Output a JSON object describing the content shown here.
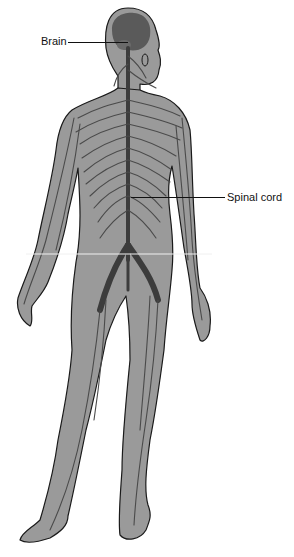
{
  "diagram": {
    "colors": {
      "body_fill": "#9a9a9a",
      "body_outline": "#1a1a1a",
      "nerve": "#4a4a4a",
      "cns": "#3c3c3c",
      "background": "#ffffff"
    },
    "labels": [
      {
        "id": "brain",
        "text": "Brain",
        "x": 41,
        "y": 35,
        "line_from": [
          68,
          42
        ],
        "line_to": [
          128,
          42
        ]
      },
      {
        "id": "spinal-cord",
        "text": "Spinal cord",
        "x": 227,
        "y": 191,
        "line_from": [
          131,
          197
        ],
        "line_to": [
          225,
          197
        ]
      }
    ]
  }
}
